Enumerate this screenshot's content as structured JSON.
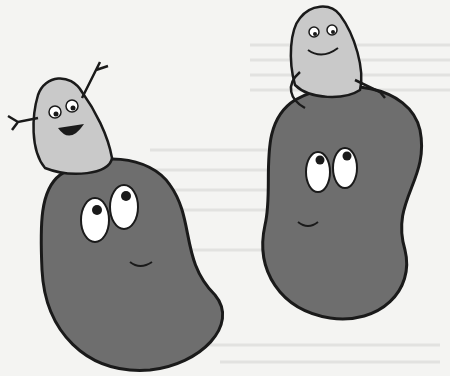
{
  "image": {
    "description": "Cartoon illustration of two kidneys with smiling adrenal glands sitting on top",
    "colors": {
      "background": "#f4f4f2",
      "kidney": "#6e6e6e",
      "adrenal": "#c9c9c9",
      "outline": "#1a1a1a",
      "eye": "#ffffff"
    }
  }
}
